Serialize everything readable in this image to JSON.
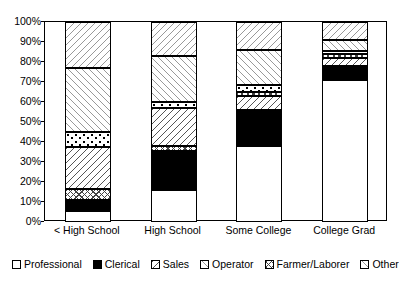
{
  "chart_data": {
    "type": "bar",
    "subtype": "stacked-percent",
    "title": "",
    "xlabel": "",
    "ylabel": "",
    "ylim": [
      0,
      100
    ],
    "grid": false,
    "legend_position": "bottom",
    "y_tick_labels": [
      "100%",
      "90%",
      "80%",
      "70%",
      "60%",
      "50%",
      "40%",
      "30%",
      "20%",
      "10%",
      "0%"
    ],
    "y_tick_values": [
      100,
      90,
      80,
      70,
      60,
      50,
      40,
      30,
      20,
      10,
      0
    ],
    "categories": [
      "< High School",
      "High School",
      "Some College",
      "College Grad"
    ],
    "series": [
      {
        "name": "Professional",
        "pattern": "solid-white",
        "values": [
          5.5,
          16.0,
          38.0,
          71.0
        ]
      },
      {
        "name": "Clerical",
        "pattern": "solid-black",
        "values": [
          5.5,
          19.5,
          18.0,
          7.0
        ]
      },
      {
        "name": "Sales",
        "pattern": "backslash",
        "values": [
          0.0,
          0.0,
          7.0,
          4.0
        ]
      },
      {
        "name": "Operator",
        "pattern": "dots",
        "values": [
          7.5,
          3.0,
          3.5,
          1.5
        ]
      },
      {
        "name": "Farmer/Laborer",
        "pattern": "crosshatch",
        "values": [
          5.5,
          2.0,
          2.0,
          2.0
        ]
      },
      {
        "name": "Other",
        "pattern": "light-fslash",
        "values": [
          32.0,
          23.0,
          17.5,
          5.5
        ]
      },
      {
        "name": "None",
        "pattern": "light-bslash",
        "values": [
          23.0,
          17.0,
          14.0,
          9.0
        ]
      }
    ],
    "stack_order_bottom_to_top": [
      "Professional",
      "Clerical",
      "Farmer/Laborer",
      "Sales",
      "Operator",
      "Other",
      "None"
    ],
    "bars": [
      {
        "category": "< High School",
        "segments": [
          {
            "name": "Professional",
            "from": 0.0,
            "to": 5.5,
            "pattern": "solid-white"
          },
          {
            "name": "Clerical",
            "from": 5.5,
            "to": 11.0,
            "pattern": "solid-black"
          },
          {
            "name": "Farmer/Laborer",
            "from": 11.0,
            "to": 16.5,
            "pattern": "crosshatch"
          },
          {
            "name": "Sales",
            "from": 16.5,
            "to": 37.5,
            "pattern": "backslash"
          },
          {
            "name": "Operator",
            "from": 37.5,
            "to": 45.0,
            "pattern": "dots"
          },
          {
            "name": "Other",
            "from": 45.0,
            "to": 77.0,
            "pattern": "light-fslash"
          },
          {
            "name": "None",
            "from": 77.0,
            "to": 100.0,
            "pattern": "light-bslash"
          }
        ]
      },
      {
        "category": "High School",
        "segments": [
          {
            "name": "Professional",
            "from": 0.0,
            "to": 16.0,
            "pattern": "solid-white"
          },
          {
            "name": "Clerical",
            "from": 16.0,
            "to": 35.5,
            "pattern": "solid-black"
          },
          {
            "name": "Farmer/Laborer",
            "from": 35.5,
            "to": 38.0,
            "pattern": "crosshatch"
          },
          {
            "name": "Sales",
            "from": 38.0,
            "to": 57.0,
            "pattern": "backslash"
          },
          {
            "name": "Operator",
            "from": 57.0,
            "to": 60.0,
            "pattern": "dots"
          },
          {
            "name": "Other",
            "from": 60.0,
            "to": 83.0,
            "pattern": "light-fslash"
          },
          {
            "name": "None",
            "from": 83.0,
            "to": 100.0,
            "pattern": "light-bslash"
          }
        ]
      },
      {
        "category": "Some College",
        "segments": [
          {
            "name": "Professional",
            "from": 0.0,
            "to": 38.0,
            "pattern": "solid-white"
          },
          {
            "name": "Clerical",
            "from": 38.0,
            "to": 56.0,
            "pattern": "solid-black"
          },
          {
            "name": "Sales",
            "from": 56.0,
            "to": 63.0,
            "pattern": "backslash"
          },
          {
            "name": "Farmer/Laborer",
            "from": 63.0,
            "to": 65.0,
            "pattern": "crosshatch"
          },
          {
            "name": "Operator",
            "from": 65.0,
            "to": 68.5,
            "pattern": "dots"
          },
          {
            "name": "Other",
            "from": 68.5,
            "to": 86.0,
            "pattern": "light-fslash"
          },
          {
            "name": "None",
            "from": 86.0,
            "to": 100.0,
            "pattern": "light-bslash"
          }
        ]
      },
      {
        "category": "College Grad",
        "segments": [
          {
            "name": "Professional",
            "from": 0.0,
            "to": 71.0,
            "pattern": "solid-white"
          },
          {
            "name": "Clerical",
            "from": 71.0,
            "to": 78.0,
            "pattern": "solid-black"
          },
          {
            "name": "Sales",
            "from": 78.0,
            "to": 82.0,
            "pattern": "backslash"
          },
          {
            "name": "Farmer/Laborer",
            "from": 82.0,
            "to": 84.0,
            "pattern": "crosshatch"
          },
          {
            "name": "Operator",
            "from": 84.0,
            "to": 85.5,
            "pattern": "dots"
          },
          {
            "name": "Other",
            "from": 85.5,
            "to": 91.0,
            "pattern": "light-fslash"
          },
          {
            "name": "None",
            "from": 91.0,
            "to": 100.0,
            "pattern": "light-bslash"
          }
        ]
      }
    ],
    "legend": [
      {
        "label": "Professional",
        "pattern": "solid-white"
      },
      {
        "label": "Clerical",
        "pattern": "solid-black"
      },
      {
        "label": "Sales",
        "pattern": "backslash"
      },
      {
        "label": "Operator",
        "pattern": "light-fslash"
      },
      {
        "label": "Farmer/Laborer",
        "pattern": "crosshatch"
      },
      {
        "label": "Other",
        "pattern": "light-fslash"
      },
      {
        "label": "None",
        "pattern": "light-bslash"
      }
    ]
  }
}
